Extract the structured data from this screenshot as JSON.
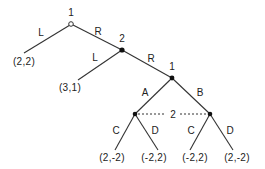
{
  "diagram": {
    "type": "extensive-form-game-tree",
    "nodes": [
      {
        "id": "root",
        "player": "1",
        "x": 71,
        "y": 24,
        "style": "open"
      },
      {
        "id": "n2",
        "player": "2",
        "x": 122,
        "y": 50,
        "style": "filled"
      },
      {
        "id": "n3",
        "player": "1",
        "x": 172,
        "y": 78,
        "style": "filled"
      },
      {
        "id": "n4",
        "player": "2",
        "x": 135,
        "y": 114,
        "style": "filled"
      },
      {
        "id": "n5",
        "player": "2",
        "x": 210,
        "y": 114,
        "style": "filled"
      }
    ],
    "player_labels": {
      "root": "1",
      "n2": "2",
      "n3": "1",
      "info_set": "2"
    },
    "action_labels": {
      "root_L": "L",
      "root_R": "R",
      "n2_L": "L",
      "n2_R": "R",
      "n3_A": "A",
      "n3_B": "B",
      "n4_C": "C",
      "n4_D": "D",
      "n5_C": "C",
      "n5_D": "D"
    },
    "payoffs": {
      "root_L": "(2,2)",
      "n2_L": "(3,1)",
      "n4_C": "(2,-2)",
      "n4_D": "(-2,2)",
      "n5_C": "(-2,2)",
      "n5_D": "(2,-2)"
    },
    "information_sets": [
      {
        "player": "2",
        "nodes": [
          "n4",
          "n5"
        ],
        "style": "dotted"
      }
    ]
  }
}
